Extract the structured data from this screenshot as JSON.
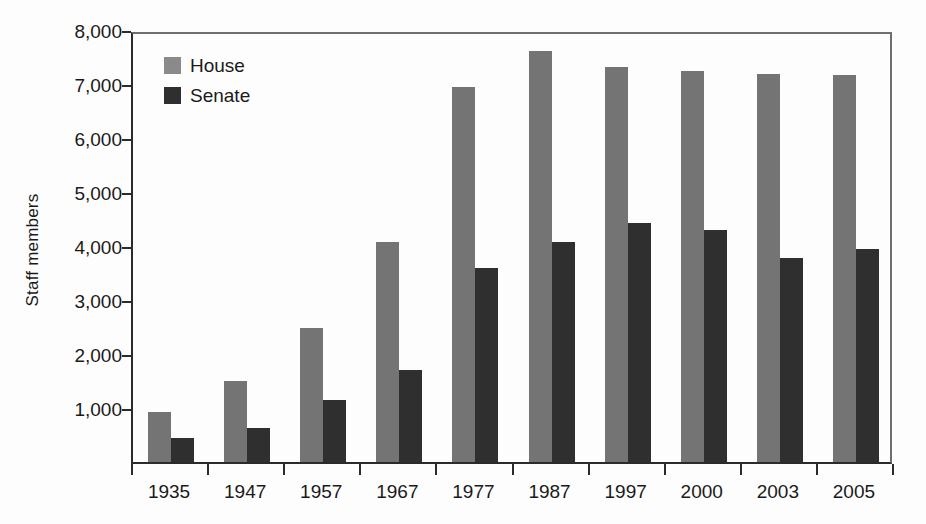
{
  "chart_data": {
    "type": "bar",
    "title": "",
    "xlabel": "",
    "ylabel": "Staff members",
    "ylim": [
      0,
      8000
    ],
    "ytick_labels": [
      "8,000",
      "7,000",
      "6,000",
      "5,000",
      "4,000",
      "3,000",
      "2,000",
      "1,000"
    ],
    "ytick_values": [
      8000,
      7000,
      6000,
      5000,
      4000,
      3000,
      2000,
      1000
    ],
    "grid": false,
    "legend_position": "top-left",
    "categories": [
      "1935",
      "1947",
      "1957",
      "1967",
      "1977",
      "1987",
      "1997",
      "2000",
      "2003",
      "2005"
    ],
    "series": [
      {
        "name": "House",
        "color": "#747474",
        "values": [
          920,
          1500,
          2480,
          4080,
          6950,
          7620,
          7320,
          7250,
          7180,
          7170
        ]
      },
      {
        "name": "Senate",
        "color": "#2f2f2f",
        "values": [
          450,
          630,
          1150,
          1700,
          3600,
          4070,
          4420,
          4300,
          3770,
          3950
        ]
      }
    ]
  },
  "legend": {
    "items": [
      {
        "label": "House",
        "swatch": "house-swatch"
      },
      {
        "label": "Senate",
        "swatch": "senate-swatch"
      }
    ]
  },
  "colors": {
    "house": "#747474",
    "senate": "#2f2f2f",
    "axis": "#2b2b2b",
    "frame": "#6f6f6f",
    "background": "#fdfdfd"
  }
}
